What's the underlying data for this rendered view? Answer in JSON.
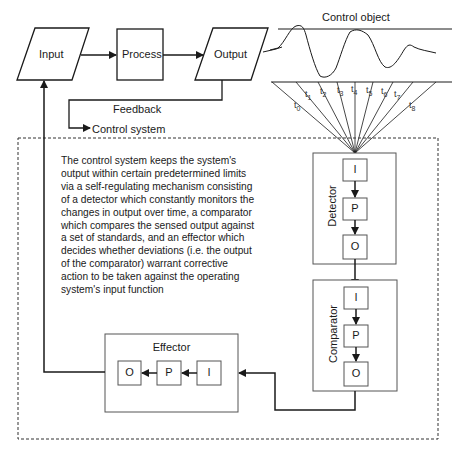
{
  "top_flow": {
    "input": "Input",
    "process": "Process",
    "output": "Output",
    "feedback": "Feedback",
    "control_system": "Control system"
  },
  "control_object": {
    "label": "Control object",
    "time_labels": [
      "t",
      "t",
      "t",
      "t",
      "t",
      "t",
      "t",
      "t",
      "t"
    ],
    "time_subscripts": [
      "0",
      "1",
      "2",
      "3",
      "4",
      "5",
      "6",
      "7",
      "8"
    ]
  },
  "description": "The control system keeps the system's\noutput within certain predetermined limits\nvia a self-regulating mechanism consisting\nof a detector which constantly monitors the\nchanges in output over time, a comparator\nwhich compares the sensed output against\na set of standards, and an effector which\ndecides whether deviations (i.e. the output\nof the comparator) warrant corrective\naction to be taken against the operating\nsystem's input function",
  "detector": {
    "label": "Detector",
    "i": "I",
    "p": "P",
    "o": "O"
  },
  "comparator": {
    "label": "Comparator",
    "i": "I",
    "p": "P",
    "o": "O"
  },
  "effector": {
    "label": "Effector",
    "i": "I",
    "p": "P",
    "o": "O"
  },
  "colors": {
    "line": "#1a1a1a",
    "box_border": "#555555",
    "dashed": "#333333"
  }
}
